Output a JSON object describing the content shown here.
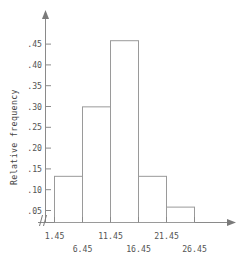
{
  "chart_data": {
    "type": "bar",
    "title": "",
    "subtitle": "",
    "xlabel": "",
    "ylabel": "Relative frequency",
    "categories": [
      "1.45-6.45",
      "6.45-11.45",
      "11.45-16.45",
      "16.45-21.45",
      "21.45-26.45"
    ],
    "bin_edges": [
      1.45,
      6.45,
      11.45,
      16.45,
      21.45,
      26.45
    ],
    "values": [
      0.111,
      0.278,
      0.437,
      0.111,
      0.037
    ],
    "xlim": [
      1.45,
      26.45
    ],
    "ylim": [
      0,
      0.47
    ],
    "grid": false,
    "legend": null,
    "axis_break": "//",
    "x_tick_labels_row1": [
      "1.45",
      "11.45",
      "21.45"
    ],
    "x_tick_labels_row2": [
      "6.45",
      "16.45",
      "26.45"
    ],
    "y_tick_labels": [
      ".45",
      ".40",
      ".35",
      ".30",
      ".25",
      ".20",
      ".15",
      ".10",
      ".05"
    ],
    "y_tick_values": [
      0.45,
      0.4,
      0.35,
      0.3,
      0.25,
      0.2,
      0.15,
      0.1,
      0.05
    ],
    "colors": {
      "bar_stroke": "#9a9a9a",
      "axis": "#8a8a8a",
      "text": "#555555",
      "background": "#ffffff"
    }
  },
  "axes": {
    "y_title": "Relative frequency",
    "break_symbol": "//"
  },
  "ticks": {
    "y": [
      {
        "label": ".45",
        "value": 0.45
      },
      {
        "label": ".40",
        "value": 0.4
      },
      {
        "label": ".35",
        "value": 0.35
      },
      {
        "label": ".30",
        "value": 0.3
      },
      {
        "label": ".25",
        "value": 0.25
      },
      {
        "label": ".20",
        "value": 0.2
      },
      {
        "label": ".15",
        "value": 0.15
      },
      {
        "label": ".10",
        "value": 0.1
      },
      {
        "label": ".05",
        "value": 0.05
      }
    ],
    "x": [
      {
        "label": "1.45",
        "value": 1.45,
        "row": 1
      },
      {
        "label": "6.45",
        "value": 6.45,
        "row": 2
      },
      {
        "label": "11.45",
        "value": 11.45,
        "row": 1
      },
      {
        "label": "16.45",
        "value": 16.45,
        "row": 2
      },
      {
        "label": "21.45",
        "value": 21.45,
        "row": 1
      },
      {
        "label": "26.45",
        "value": 26.45,
        "row": 2
      }
    ]
  }
}
